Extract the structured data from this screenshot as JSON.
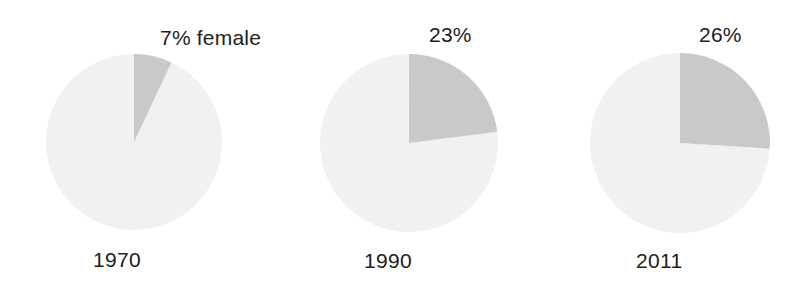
{
  "figure": {
    "background_color": "#ffffff",
    "text_color": "#1c1c1c",
    "female_slice_color": "#c9c9c9",
    "male_slice_color": "#f1f1f1"
  },
  "chart_data": {
    "type": "pie",
    "title": "",
    "subtitle": "",
    "xlabel": "",
    "ylabel": "",
    "legend_position": "none",
    "grid": false,
    "series_names": [
      "female",
      "male"
    ],
    "annotations": [
      "7% female"
    ],
    "charts": [
      {
        "year_label": "1970",
        "pct_label": "7% female",
        "female_pct": 7,
        "male_pct": 93,
        "start_angle_deg": 0,
        "sweep_deg": 25.2,
        "center_x": 134,
        "center_y": 142,
        "radius": 88
      },
      {
        "year_label": "1990",
        "pct_label": "23%",
        "female_pct": 23,
        "male_pct": 77,
        "start_angle_deg": 0,
        "sweep_deg": 82.8,
        "center_x": 137,
        "center_y": 143,
        "radius": 89
      },
      {
        "year_label": "2011",
        "pct_label": "26%",
        "female_pct": 26,
        "male_pct": 74,
        "start_angle_deg": 0,
        "sweep_deg": 93.6,
        "center_x": 136,
        "center_y": 143,
        "radius": 90
      }
    ]
  }
}
